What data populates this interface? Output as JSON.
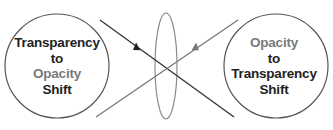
{
  "diagram": {
    "left_circle": {
      "lines": [
        {
          "text": "Transparency",
          "tone": "dark"
        },
        {
          "text": "to",
          "tone": "dark"
        },
        {
          "text": "Opacity",
          "tone": "gray"
        },
        {
          "text": "Shift",
          "tone": "dark"
        }
      ]
    },
    "right_circle": {
      "lines": [
        {
          "text": "Opacity",
          "tone": "gray"
        },
        {
          "text": "to",
          "tone": "dark"
        },
        {
          "text": "Transparency",
          "tone": "dark"
        },
        {
          "text": "Shift",
          "tone": "dark"
        }
      ]
    },
    "colors": {
      "dark": "#222222",
      "gray": "#7a7a7a",
      "outline": "#555555",
      "ellipse": "#8a8a8a"
    }
  }
}
